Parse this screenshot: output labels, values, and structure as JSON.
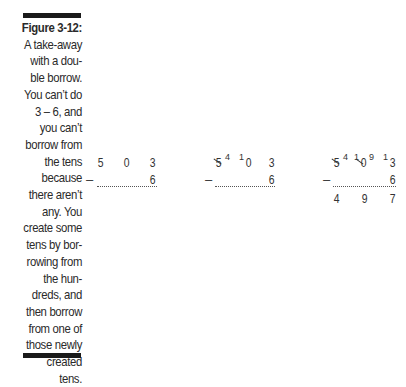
{
  "caption": {
    "figure_label": "Figure 3-12:",
    "lines": [
      "A take-away",
      "with a dou-",
      "ble borrow.",
      "You can’t do",
      "3 – 6, and",
      "you can’t",
      "borrow from",
      "the tens",
      "because",
      "there aren’t",
      "any. You",
      "create some",
      "tens by bor-",
      "rowing from",
      "the hun-",
      "dreds, and",
      "then borrow",
      "from one of",
      "those newly",
      "created",
      "tens."
    ]
  },
  "problems": [
    {
      "top": [
        "5",
        "0",
        "3"
      ],
      "operator": "–",
      "subtrahend": "6"
    },
    {
      "top": [
        "5",
        "0",
        "3"
      ],
      "borrow_marks": {
        "hundreds_new": "4",
        "tens_carry": "1"
      },
      "operator": "–",
      "subtrahend": "6"
    },
    {
      "top": [
        "5",
        "0",
        "3"
      ],
      "borrow_marks": {
        "hundreds_new": "4",
        "tens_carry": "1",
        "tens_new": "9",
        "ones_carry": "1"
      },
      "operator": "–",
      "subtrahend": "6",
      "result": [
        "4",
        "9",
        "7"
      ]
    }
  ]
}
